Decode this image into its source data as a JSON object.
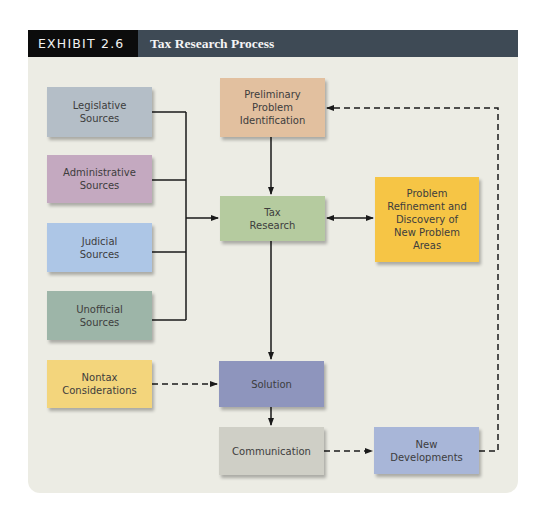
{
  "header": {
    "label": "EXHIBIT 2.6",
    "title": "Tax Research Process"
  },
  "nodes": {
    "legislative": {
      "label": "Legislative\nSources",
      "color": "#b4bec7"
    },
    "administrative": {
      "label": "Administrative\nSources",
      "color": "#c4a9c0"
    },
    "judicial": {
      "label": "Judicial\nSources",
      "color": "#adc6e6"
    },
    "unofficial": {
      "label": "Unofficial\nSources",
      "color": "#9db5a8"
    },
    "nontax": {
      "label": "Nontax\nConsiderations",
      "color": "#f3d57c"
    },
    "preliminary": {
      "label": "Preliminary\nProblem\nIdentification",
      "color": "#e2c09f"
    },
    "tax_research": {
      "label": "Tax\nResearch",
      "color": "#b5cb9f"
    },
    "refinement": {
      "label": "Problem\nRefinement and\nDiscovery of\nNew Problem\nAreas",
      "color": "#f6c545"
    },
    "solution": {
      "label": "Solution",
      "color": "#8e95bd"
    },
    "communication": {
      "label": "Communication",
      "color": "#cfcfc6"
    },
    "new_developments": {
      "label": "New\nDevelopments",
      "color": "#a8b6d8"
    }
  },
  "edges": [
    {
      "from": "legislative",
      "to": "tax_research",
      "style": "solid"
    },
    {
      "from": "administrative",
      "to": "tax_research",
      "style": "solid"
    },
    {
      "from": "judicial",
      "to": "tax_research",
      "style": "solid"
    },
    {
      "from": "unofficial",
      "to": "tax_research",
      "style": "solid"
    },
    {
      "from": "preliminary",
      "to": "tax_research",
      "style": "solid"
    },
    {
      "from": "tax_research",
      "to": "refinement",
      "style": "solid",
      "bidirectional": true
    },
    {
      "from": "tax_research",
      "to": "solution",
      "style": "solid"
    },
    {
      "from": "nontax",
      "to": "solution",
      "style": "dashed"
    },
    {
      "from": "solution",
      "to": "communication",
      "style": "solid"
    },
    {
      "from": "communication",
      "to": "new_developments",
      "style": "dashed"
    },
    {
      "from": "new_developments",
      "to": "preliminary",
      "style": "dashed"
    }
  ]
}
